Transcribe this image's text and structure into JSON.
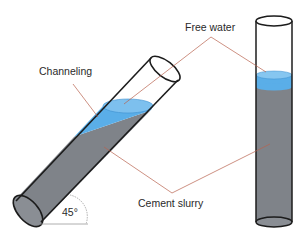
{
  "labels": {
    "free_water": "Free water",
    "channeling": "Channeling",
    "cement_slurry": "Cement slurry",
    "angle": "45°"
  },
  "colors": {
    "slurry": "#7f8389",
    "water": "#5aaee8",
    "water_surface": "#86c6f0",
    "outline": "#1c1c1c",
    "leader": "#b8614e",
    "angle_arc": "#9a9a9a"
  },
  "tubes": [
    {
      "name": "tilted-tube",
      "tilt_degrees": 45,
      "contents": [
        "Cement slurry",
        "Free water",
        "Channeling"
      ]
    },
    {
      "name": "vertical-tube",
      "tilt_degrees": 90,
      "contents": [
        "Cement slurry",
        "Free water"
      ]
    }
  ]
}
